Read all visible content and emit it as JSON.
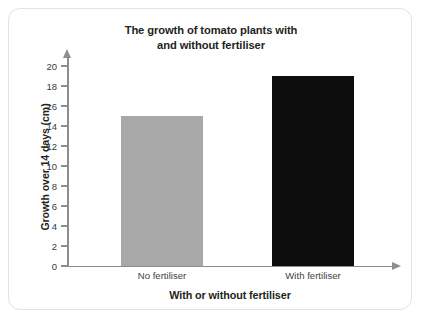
{
  "chart_data": {
    "type": "bar",
    "title": "The growth of tomato plants with and without fertiliser",
    "title_lines": [
      "The growth of tomato plants with",
      "and without fertiliser"
    ],
    "xlabel": "With or without fertiliser",
    "ylabel": "Growth over 14 days (cm)",
    "categories": [
      "No fertiliser",
      "With fertiliser"
    ],
    "values": [
      15,
      19
    ],
    "ylim": [
      0,
      21
    ],
    "ytick_labels": [
      "0",
      "2",
      "4",
      "6",
      "8",
      "10",
      "12",
      "14",
      "16",
      "18",
      "20"
    ],
    "ytick_values": [
      0,
      2,
      4,
      6,
      8,
      10,
      12,
      14,
      16,
      18,
      20
    ],
    "bar_colors": [
      "#a8a8a8",
      "#0d0d0d"
    ],
    "grid": false,
    "legend": false,
    "axis_color": "#8d8d8d",
    "card_border_color": "#e2e2e2",
    "background": "#ffffff"
  }
}
